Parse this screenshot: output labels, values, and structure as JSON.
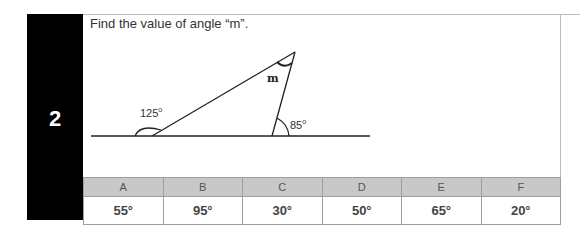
{
  "question": {
    "number": "2",
    "text": "Find the value of angle “m”."
  },
  "diagram": {
    "angle_left": "125",
    "angle_right": "85",
    "angle_unknown": "m",
    "degree_symbol": "o"
  },
  "options": {
    "labels": [
      "A",
      "B",
      "C",
      "D",
      "E",
      "F"
    ],
    "values": [
      "55°",
      "95°",
      "30°",
      "50°",
      "65°",
      "20°"
    ]
  }
}
